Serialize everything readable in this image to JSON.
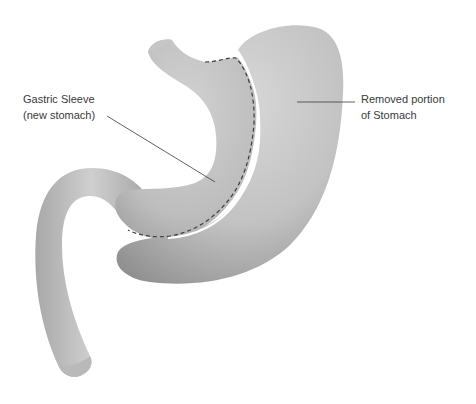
{
  "diagram": {
    "labels": {
      "sleeve": {
        "line1": "Gastric Sleeve",
        "line2": "(new stomach)"
      },
      "removed": {
        "line1": "Removed portion",
        "line2": "of Stomach"
      }
    },
    "parts": [
      "esophagus",
      "gastric-sleeve",
      "removed-portion",
      "staple-line",
      "duodenum"
    ],
    "colors": {
      "background": "#ffffff",
      "organ_light": "#d6d6d6",
      "organ_mid": "#b4b4b4",
      "organ_dark": "#8e8e8e",
      "staple_line": "#3c3c3c",
      "leader_line": "#3a3a3a",
      "text": "#3a3a3a"
    }
  }
}
